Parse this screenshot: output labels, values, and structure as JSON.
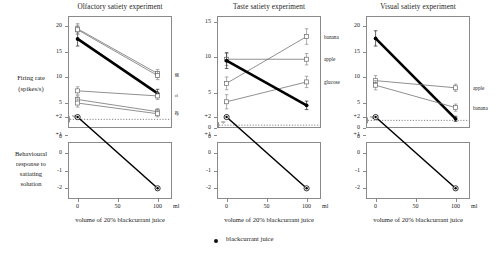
{
  "figure": {
    "legend_label": "blackcurrant juice",
    "legend_marker": "filled-circle",
    "xaxis_title": "volume of 20% blackcurrant juice",
    "xaxis_unit": "ml",
    "firing_axis_title_line1": "Firing rate",
    "firing_axis_title_line2": "(spikes/s)",
    "behav_axis_title_line1": "Behavioural",
    "behav_axis_title_line2": "response to",
    "behav_axis_title_line3": "satiating",
    "behav_axis_title_line4": "solution",
    "spontaneous_label": "sp"
  },
  "chart_data": [
    {
      "type": "line",
      "title": "Olfactory satiety experiment",
      "xlabel": "volume of 20% blackcurrant juice",
      "ylabel": "Firing rate (spikes/s)",
      "x": [
        0,
        100
      ],
      "xlim": [
        -12,
        118
      ],
      "ylim": [
        0,
        22
      ],
      "yticks": [
        5,
        10,
        15,
        20
      ],
      "xticks": [
        0,
        50,
        100
      ],
      "xtick_labels": [
        "0",
        "50",
        "100"
      ],
      "grid": false,
      "spontaneous_rate": 1.7,
      "series": [
        {
          "name": "ap",
          "label": "ap",
          "values": [
            19.5,
            10.7
          ],
          "errors": [
            1.0,
            0.8
          ],
          "marker": "open-square",
          "style": "thin"
        },
        {
          "name": "blackcurrant juice",
          "label": "",
          "values": [
            17.5,
            6.8
          ],
          "errors": [
            1.4,
            0.8
          ],
          "marker": "filled-circle",
          "style": "thick"
        },
        {
          "name": "ba",
          "label": "ba",
          "values": [
            19.3,
            10.3
          ],
          "errors": [
            0.9,
            0.8
          ],
          "marker": "open-square",
          "style": "thin"
        },
        {
          "name": "cl",
          "label": "cl",
          "values": [
            7.3,
            6.3
          ],
          "errors": [
            0.8,
            0.7
          ],
          "marker": "open-square",
          "style": "thin"
        },
        {
          "name": "pe",
          "label": "pe",
          "values": [
            5.6,
            3.2
          ],
          "errors": [
            0.7,
            0.6
          ],
          "marker": "open-square",
          "style": "thin"
        },
        {
          "name": "cp",
          "label": "cp",
          "values": [
            4.9,
            2.8
          ],
          "errors": [
            0.8,
            0.6
          ],
          "marker": "open-square",
          "style": "thin"
        }
      ]
    },
    {
      "type": "line",
      "title": "Taste satiety experiment",
      "xlabel": "volume of 20% blackcurrant juice",
      "ylabel": "Firing rate (spikes/s)",
      "x": [
        0,
        100
      ],
      "xlim": [
        -12,
        118
      ],
      "ylim": [
        0,
        15.8
      ],
      "yticks": [
        0,
        5,
        10,
        15
      ],
      "xticks": [
        0,
        50,
        100
      ],
      "xtick_labels": [
        "0",
        "50",
        "100"
      ],
      "grid": false,
      "spontaneous_rate": 0.4,
      "series": [
        {
          "name": "banana",
          "label": "banana",
          "values": [
            6.3,
            12.9
          ],
          "errors": [
            0.9,
            1.1
          ],
          "marker": "open-square",
          "style": "thin"
        },
        {
          "name": "apple",
          "label": "apple",
          "values": [
            9.7,
            9.7
          ],
          "errors": [
            0.9,
            0.8
          ],
          "marker": "open-square",
          "style": "thin"
        },
        {
          "name": "glucose",
          "label": "glucose",
          "values": [
            3.7,
            6.5
          ],
          "errors": [
            1.0,
            0.8
          ],
          "marker": "open-square",
          "style": "thin"
        },
        {
          "name": "blackcurrant juice",
          "label": "",
          "values": [
            9.5,
            3.2
          ],
          "errors": [
            1.1,
            0.6
          ],
          "marker": "filled-circle",
          "style": "thick"
        }
      ]
    },
    {
      "type": "line",
      "title": "Visual satiety experiment",
      "xlabel": "volume of 20% blackcurrant juice",
      "ylabel": "Firing rate (spikes/s)",
      "x": [
        0,
        100
      ],
      "xlim": [
        -12,
        118
      ],
      "ylim": [
        0,
        22
      ],
      "yticks": [
        0,
        5,
        10,
        15,
        20
      ],
      "xticks": [
        0,
        50,
        100
      ],
      "xtick_labels": [
        "0",
        "50",
        "100"
      ],
      "grid": false,
      "spontaneous_rate": 1.5,
      "series": [
        {
          "name": "blackcurrant juice",
          "label": "",
          "values": [
            17.6,
            1.8
          ],
          "errors": [
            1.5,
            0.5
          ],
          "marker": "filled-circle",
          "style": "thick"
        },
        {
          "name": "apple",
          "label": "apple",
          "values": [
            9.3,
            7.9
          ],
          "errors": [
            1.0,
            0.7
          ],
          "marker": "open-square",
          "style": "thin"
        },
        {
          "name": "banana",
          "label": "banana",
          "values": [
            8.4,
            4.0
          ],
          "errors": [
            0.9,
            0.7
          ],
          "marker": "open-square",
          "style": "thin"
        }
      ]
    },
    {
      "type": "line",
      "title": "",
      "panel": "behavioural-left",
      "xlabel": "volume of 20% blackcurrant juice",
      "ylabel": "Behavioural response to satiating solution",
      "x": [
        0,
        100
      ],
      "xlim": [
        -12,
        118
      ],
      "ylim": [
        -2.6,
        0.6
      ],
      "yticks": [
        0,
        2,
        1,
        0,
        -1,
        -2
      ],
      "ytick_labels": [
        "0",
        "+2",
        "+1",
        "0",
        "-1",
        "-2"
      ],
      "xticks": [
        0,
        50,
        100
      ],
      "xtick_labels": [
        "0",
        "50",
        "100"
      ],
      "grid": false,
      "series": [
        {
          "name": "blackcurrant juice",
          "values": [
            2,
            -2
          ],
          "marker": "filled-circle-open-ring",
          "style": "medium"
        }
      ]
    },
    {
      "type": "line",
      "title": "",
      "panel": "behavioural-middle",
      "xlabel": "volume of 20% blackcurrant juice",
      "ylabel": "Behavioural response to satiating solution",
      "x": [
        0,
        100
      ],
      "xlim": [
        -12,
        118
      ],
      "ylim": [
        -2.6,
        0.6
      ],
      "yticks": [
        0,
        2,
        1,
        0,
        -1,
        -2
      ],
      "ytick_labels": [
        "0",
        "+2",
        "+1",
        "0",
        "-1",
        "-2"
      ],
      "xticks": [
        0,
        50,
        100
      ],
      "xtick_labels": [
        "0",
        "50",
        "100"
      ],
      "grid": false,
      "series": [
        {
          "name": "blackcurrant juice",
          "values": [
            2,
            -2
          ],
          "marker": "filled-circle-open-ring",
          "style": "medium"
        }
      ]
    },
    {
      "type": "line",
      "title": "",
      "panel": "behavioural-right",
      "xlabel": "volume of 20% blackcurrant juice",
      "ylabel": "Behavioural response to satiating solution",
      "x": [
        0,
        100
      ],
      "xlim": [
        -12,
        118
      ],
      "ylim": [
        -2.6,
        0.6
      ],
      "yticks": [
        0,
        2,
        1,
        0,
        -1,
        -2
      ],
      "ytick_labels": [
        "0",
        "+2",
        "+1",
        "0",
        "-1",
        "-2"
      ],
      "xticks": [
        0,
        50,
        100
      ],
      "xtick_labels": [
        "0",
        "50",
        "100"
      ],
      "grid": false,
      "series": [
        {
          "name": "blackcurrant juice",
          "values": [
            2,
            -2
          ],
          "marker": "filled-circle-open-ring",
          "style": "medium"
        }
      ]
    }
  ]
}
